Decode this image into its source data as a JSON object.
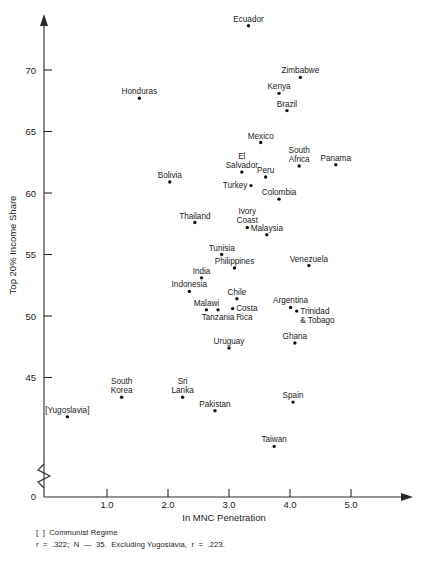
{
  "chart_data": {
    "type": "scatter",
    "title": "",
    "xlabel": "In MNC Penetration",
    "ylabel": "Top 20% Income Share",
    "xlim": [
      0.0,
      5.9
    ],
    "ylim": [
      38.0,
      74.5
    ],
    "xticks": [
      "1.0",
      "2.0",
      "3.0",
      "4.0",
      "5.0"
    ],
    "xtick_values": [
      1.0,
      2.0,
      3.0,
      4.0,
      5.0
    ],
    "yticks": [
      "45",
      "50",
      "55",
      "60",
      "65",
      "70"
    ],
    "ytick_values": [
      45,
      50,
      55,
      60,
      65,
      70
    ],
    "origin_label": "0",
    "grid": false,
    "legend": "none",
    "axis_break": "y-axis break below 45",
    "points": [
      {
        "label": "Ecuador",
        "x": 3.32,
        "y": 73.6,
        "label_pos": "above"
      },
      {
        "label": "Zimbabwe",
        "x": 4.17,
        "y": 69.4,
        "label_pos": "above"
      },
      {
        "label": "Kenya",
        "x": 3.82,
        "y": 68.1,
        "label_pos": "above"
      },
      {
        "label": "Honduras",
        "x": 1.53,
        "y": 67.7,
        "label_pos": "above"
      },
      {
        "label": "Brazil",
        "x": 3.95,
        "y": 66.7,
        "label_pos": "above"
      },
      {
        "label": "Mexico",
        "x": 3.52,
        "y": 64.1,
        "label_pos": "above"
      },
      {
        "label": "South Africa",
        "x": 4.15,
        "y": 62.2,
        "label_pos": "above"
      },
      {
        "label": "Panama",
        "x": 4.75,
        "y": 62.3,
        "label_pos": "above"
      },
      {
        "label": "El Salvador",
        "x": 3.21,
        "y": 61.7,
        "label_pos": "above"
      },
      {
        "label": "Peru",
        "x": 3.6,
        "y": 61.3,
        "label_pos": "above"
      },
      {
        "label": "Bolivia",
        "x": 2.03,
        "y": 60.9,
        "label_pos": "above"
      },
      {
        "label": "Turkey",
        "x": 3.36,
        "y": 60.6,
        "label_pos": "left"
      },
      {
        "label": "Colombia",
        "x": 3.82,
        "y": 59.5,
        "label_pos": "above"
      },
      {
        "label": "Thailand",
        "x": 2.44,
        "y": 57.6,
        "label_pos": "above"
      },
      {
        "label": "Ivory Coast",
        "x": 3.3,
        "y": 57.2,
        "label_pos": "above"
      },
      {
        "label": "Malaysia",
        "x": 3.62,
        "y": 56.6,
        "label_pos": "above"
      },
      {
        "label": "Tunisia",
        "x": 2.88,
        "y": 55.0,
        "label_pos": "above"
      },
      {
        "label": "Venezuela",
        "x": 4.31,
        "y": 54.1,
        "label_pos": "above"
      },
      {
        "label": "Philippines",
        "x": 3.09,
        "y": 53.9,
        "label_pos": "above"
      },
      {
        "label": "India",
        "x": 2.55,
        "y": 53.1,
        "label_pos": "above"
      },
      {
        "label": "Indonesia",
        "x": 2.35,
        "y": 52.0,
        "label_pos": "above"
      },
      {
        "label": "Chile",
        "x": 3.13,
        "y": 51.4,
        "label_pos": "above"
      },
      {
        "label": "Argentina",
        "x": 4.01,
        "y": 50.7,
        "label_pos": "above"
      },
      {
        "label": "Costa Rica",
        "x": 3.06,
        "y": 50.6,
        "label_pos": "right"
      },
      {
        "label": "Malawi",
        "x": 2.63,
        "y": 50.5,
        "label_pos": "above"
      },
      {
        "label": "Tanzania",
        "x": 2.82,
        "y": 50.5,
        "label_pos": "below"
      },
      {
        "label": "Trinidad & Tobago",
        "x": 4.11,
        "y": 50.4,
        "label_pos": "right"
      },
      {
        "label": "Ghana",
        "x": 4.08,
        "y": 47.8,
        "label_pos": "above"
      },
      {
        "label": "Uruguay",
        "x": 3.0,
        "y": 47.4,
        "label_pos": "above"
      },
      {
        "label": "South Korea",
        "x": 1.24,
        "y": 43.4,
        "label_pos": "above"
      },
      {
        "label": "Sri Lanka",
        "x": 2.24,
        "y": 43.4,
        "label_pos": "above"
      },
      {
        "label": "Pakistan",
        "x": 2.77,
        "y": 42.3,
        "label_pos": "above"
      },
      {
        "label": "Spain",
        "x": 4.05,
        "y": 43.0,
        "label_pos": "above"
      },
      {
        "label": "[Yugoslavia]",
        "x": 0.35,
        "y": 41.8,
        "label_pos": "above"
      },
      {
        "label": "Taiwan",
        "x": 3.74,
        "y": 39.4,
        "label_pos": "above"
      }
    ],
    "annotations": {
      "legend_note": "[  ]  Communist Regime",
      "stats_note": "r  =  .322;  N  —  35.  Excluding Yugoslavia,  r  =  .223."
    },
    "statistics": {
      "r_all": 0.322,
      "n": 35,
      "r_excluding_yugoslavia": 0.223
    }
  },
  "colors": {
    "marker": "#111111",
    "axis": "#2a2a2a",
    "text": "#1a1a1a",
    "background": "#ffffff"
  }
}
